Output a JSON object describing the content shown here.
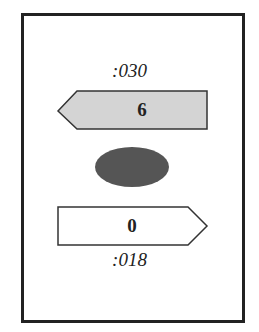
{
  "diagram": {
    "top_label": ":030",
    "top_arrow": {
      "direction": "left",
      "value": "6",
      "fill": "#d4d4d4"
    },
    "center_ellipse": {
      "fill": "#555555"
    },
    "bottom_arrow": {
      "direction": "right",
      "value": "0",
      "fill": "#ffffff"
    },
    "bottom_label": ":018",
    "stroke_color": "#222222"
  }
}
